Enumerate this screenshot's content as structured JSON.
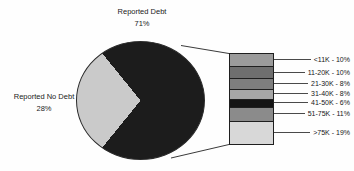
{
  "chart_data": {
    "type": "pie",
    "title": "",
    "legend_position": "none",
    "slices": [
      {
        "label": "Reported Debt",
        "value": 71,
        "pct_label": "71%",
        "color": "#1c1c1c"
      },
      {
        "label": "Reported No Debt",
        "value": 28,
        "pct_label": "28%",
        "color": "#cacaca"
      }
    ],
    "breakout": {
      "of_slice": "Reported Debt",
      "type": "stacked-bar",
      "segments": [
        {
          "range": "<11K",
          "value": 10,
          "display": "<11K - 10%",
          "color": "#9b9b9b"
        },
        {
          "range": "11-20K",
          "value": 10,
          "display": "11-20K - 10%",
          "color": "#6f6f6f"
        },
        {
          "range": "21-30K",
          "value": 8,
          "display": "21-30K - 8%",
          "color": "#7e7e7e"
        },
        {
          "range": "31-40K",
          "value": 8,
          "display": "31-40K - 8%",
          "color": "#a6a6a6"
        },
        {
          "range": "41-50K",
          "value": 6,
          "display": "41-50K - 6%",
          "color": "#151515"
        },
        {
          "range": "51-75K",
          "value": 11,
          "display": "51-75K - 11%",
          "color": "#8b8b8b"
        },
        {
          "range": ">75K",
          "value": 19,
          "display": ">75K - 19%",
          "color": "#d8d8d8"
        }
      ]
    }
  }
}
